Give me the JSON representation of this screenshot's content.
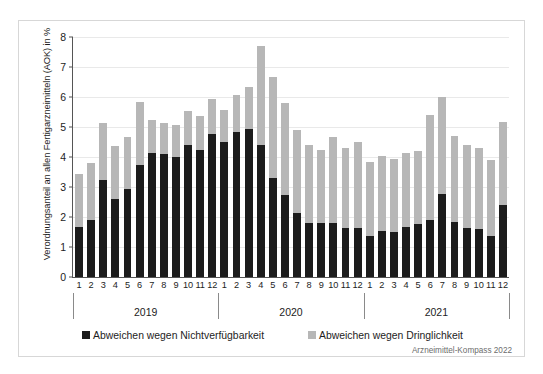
{
  "chart_data": {
    "type": "bar",
    "subtype": "stacked",
    "title": "",
    "xlabel": "",
    "ylabel": "Verordnungsanteil an allen Fertigarzneimitteln (AOK) in %",
    "ylim": [
      0,
      8
    ],
    "yticks": [
      0,
      1,
      2,
      3,
      4,
      5,
      6,
      7,
      8
    ],
    "ytick_labels": [
      "0",
      "1",
      "2",
      "3",
      "4",
      "5",
      "6",
      "7",
      "8"
    ],
    "grid": true,
    "legend_position": "bottom",
    "source": "Arzneimittel-Kompass 2022",
    "groups": [
      {
        "label": "2019",
        "categories": [
          "1",
          "2",
          "3",
          "4",
          "5",
          "6",
          "7",
          "8",
          "9",
          "10",
          "11",
          "12"
        ]
      },
      {
        "label": "2020",
        "categories": [
          "1",
          "2",
          "3",
          "4",
          "5",
          "6",
          "7",
          "8",
          "9",
          "10",
          "11",
          "12"
        ]
      },
      {
        "label": "2021",
        "categories": [
          "1",
          "2",
          "3",
          "4",
          "5",
          "6",
          "7",
          "8",
          "9",
          "10",
          "11",
          "12"
        ]
      }
    ],
    "categories": [
      "1",
      "2",
      "3",
      "4",
      "5",
      "6",
      "7",
      "8",
      "9",
      "10",
      "11",
      "12",
      "1",
      "2",
      "3",
      "4",
      "5",
      "6",
      "7",
      "8",
      "9",
      "10",
      "11",
      "12",
      "1",
      "2",
      "3",
      "4",
      "5",
      "6",
      "7",
      "8",
      "9",
      "10",
      "11",
      "12"
    ],
    "series": [
      {
        "name": "Abweichen wegen Nichtverfügbarkeit",
        "color": "#1c1c1c",
        "values": [
          1.68,
          1.9,
          3.25,
          2.6,
          2.95,
          3.72,
          4.12,
          4.1,
          4.0,
          4.4,
          4.24,
          4.78,
          4.5,
          4.85,
          4.95,
          4.41,
          3.3,
          2.74,
          2.15,
          1.8,
          1.8,
          1.8,
          1.65,
          1.65,
          1.37,
          1.52,
          1.5,
          1.68,
          1.78,
          1.89,
          2.78,
          1.82,
          1.63,
          1.6,
          1.38,
          2.4
        ]
      },
      {
        "name": "Abweichen wegen Dringlichkeit",
        "color": "#b7b7b7",
        "values": [
          1.74,
          1.9,
          1.9,
          1.77,
          1.73,
          2.12,
          1.12,
          1.05,
          1.07,
          1.15,
          1.14,
          1.17,
          1.06,
          1.22,
          1.39,
          3.29,
          3.38,
          3.06,
          2.75,
          2.59,
          2.45,
          2.87,
          2.66,
          2.85,
          2.45,
          2.53,
          2.44,
          2.46,
          2.43,
          3.51,
          3.21,
          2.87,
          2.76,
          2.69,
          2.53,
          2.76
        ]
      }
    ],
    "totals": [
      3.42,
      3.8,
      5.15,
      4.37,
      4.68,
      5.84,
      5.24,
      5.15,
      5.07,
      5.55,
      5.38,
      5.95,
      5.56,
      6.07,
      6.34,
      7.7,
      6.68,
      5.8,
      4.9,
      4.39,
      4.25,
      4.67,
      4.31,
      4.5,
      3.82,
      4.05,
      3.94,
      4.14,
      4.21,
      5.4,
      5.99,
      4.69,
      4.39,
      4.29,
      3.91,
      5.16
    ]
  },
  "legend": {
    "items": [
      {
        "label": "Abweichen wegen Nichtverfügbarkeit",
        "swatch": "dark-square-icon"
      },
      {
        "label": "Abweichen wegen Dringlichkeit",
        "swatch": "gray-square-icon"
      }
    ]
  },
  "source_note": "Arzneimittel-Kompass 2022"
}
